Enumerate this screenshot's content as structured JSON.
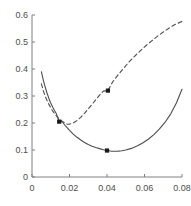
{
  "chart_data": {
    "type": "line",
    "title": "",
    "xlabel": "",
    "ylabel": "",
    "xlim": [
      0,
      0.08
    ],
    "ylim": [
      0,
      0.6
    ],
    "grid": false,
    "legend": "none",
    "xticks": [
      0,
      0.02,
      0.04,
      0.06,
      0.08
    ],
    "xticklabels": [
      "0",
      "0.02",
      "0.04",
      "0.06",
      "0.08"
    ],
    "yticks": [
      0,
      0.1,
      0.2,
      0.3,
      0.4,
      0.5,
      0.6
    ],
    "yticklabels": [
      "0",
      "0.1",
      "0.2",
      "0.3",
      "0.4",
      "0.5",
      "0.6"
    ],
    "axis_color": "#808080",
    "series": [
      {
        "name": "solid-curve",
        "style": "solid",
        "color": "#4d4d4d",
        "x": [
          0.005,
          0.006,
          0.007,
          0.008,
          0.009,
          0.01,
          0.011,
          0.012,
          0.013,
          0.0145,
          0.016,
          0.018,
          0.02,
          0.022,
          0.024,
          0.026,
          0.028,
          0.03,
          0.032,
          0.034,
          0.036,
          0.038,
          0.04,
          0.042,
          0.044,
          0.046,
          0.048,
          0.05,
          0.053,
          0.056,
          0.059,
          0.062,
          0.065,
          0.068,
          0.071,
          0.074,
          0.077,
          0.08
        ],
        "y": [
          0.39,
          0.36,
          0.334,
          0.311,
          0.291,
          0.274,
          0.259,
          0.246,
          0.234,
          0.205,
          0.206,
          0.188,
          0.173,
          0.159,
          0.147,
          0.137,
          0.128,
          0.12,
          0.114,
          0.109,
          0.105,
          0.101,
          0.098,
          0.096,
          0.0955,
          0.096,
          0.0975,
          0.1,
          0.106,
          0.115,
          0.126,
          0.14,
          0.157,
          0.178,
          0.203,
          0.234,
          0.274,
          0.325
        ]
      },
      {
        "name": "dashed-curve",
        "style": "dashed",
        "color": "#4d4d4d",
        "x": [
          0.005,
          0.006,
          0.007,
          0.008,
          0.009,
          0.01,
          0.011,
          0.012,
          0.013,
          0.0145,
          0.016,
          0.018,
          0.019,
          0.02,
          0.022,
          0.024,
          0.026,
          0.028,
          0.03,
          0.032,
          0.034,
          0.036,
          0.038,
          0.0405,
          0.043,
          0.046,
          0.049,
          0.052,
          0.055,
          0.058,
          0.061,
          0.064,
          0.067,
          0.07,
          0.073,
          0.076,
          0.08
        ],
        "y": [
          0.345,
          0.32,
          0.3,
          0.283,
          0.269,
          0.256,
          0.245,
          0.235,
          0.226,
          0.215,
          0.207,
          0.198,
          0.1955,
          0.196,
          0.2,
          0.209,
          0.221,
          0.236,
          0.252,
          0.269,
          0.286,
          0.303,
          0.318,
          0.32,
          0.352,
          0.379,
          0.404,
          0.428,
          0.449,
          0.469,
          0.488,
          0.505,
          0.522,
          0.537,
          0.551,
          0.564,
          0.576
        ]
      }
    ],
    "markers": [
      {
        "name": "marker-crossing",
        "x": 0.0145,
        "y": 0.205,
        "shape": "square",
        "color": "#1a1a1a"
      },
      {
        "name": "marker-solid-minimum",
        "x": 0.04,
        "y": 0.098,
        "shape": "square",
        "color": "#1a1a1a"
      },
      {
        "name": "marker-dashed-point",
        "x": 0.0405,
        "y": 0.32,
        "shape": "square",
        "color": "#1a1a1a"
      }
    ]
  }
}
